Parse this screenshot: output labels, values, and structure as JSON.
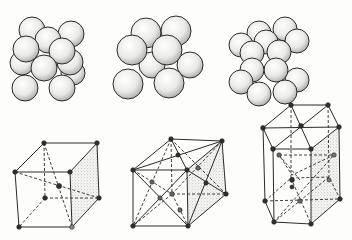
{
  "figure": {
    "colors": {
      "background": "#fdfdfc",
      "line": "#2a2a2a",
      "atom_fill": "#3a3a3a",
      "sphere_fill": "#f4f4f2",
      "stipple": "#9a9a9a"
    },
    "panels": [
      {
        "id": "bcc",
        "name": "body-centered-cubic",
        "position": "left"
      },
      {
        "id": "fcc",
        "name": "face-centered-cubic",
        "position": "middle"
      },
      {
        "id": "hcp",
        "name": "hexagonal-close-packed",
        "position": "right"
      }
    ]
  }
}
